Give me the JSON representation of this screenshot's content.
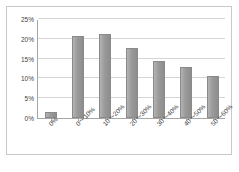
{
  "chart_data": {
    "type": "bar",
    "title": "",
    "xlabel": "",
    "ylabel": "",
    "categories": [
      "0%",
      "0～10%",
      "10～20%",
      "20～30%",
      "30～40%",
      "40～50%",
      "50～60%"
    ],
    "values": [
      1.4,
      20.8,
      21.3,
      17.6,
      14.3,
      12.9,
      10.7
    ],
    "ylim": [
      0,
      25
    ],
    "ytick_labels": [
      "0%",
      "5%",
      "10%",
      "15%",
      "20%",
      "25%"
    ],
    "ytick_values": [
      0,
      5,
      10,
      15,
      20,
      25
    ],
    "grid": true,
    "legend": false,
    "series": [
      {
        "name": "",
        "values": [
          1.4,
          20.8,
          21.3,
          17.6,
          14.3,
          12.9,
          10.7
        ]
      }
    ],
    "colors": {
      "bar_fill_light": "#b3b3b3",
      "bar_fill_dark": "#8d8d8d",
      "bar_border": "#8a8a8a",
      "gridline": "#d4d4d4",
      "axis_line": "#a6a6a6",
      "frame_border": "#c8c8c8",
      "tick_text": "#3f3f3f",
      "background": "#ffffff"
    }
  },
  "caption": {
    "text": ""
  }
}
